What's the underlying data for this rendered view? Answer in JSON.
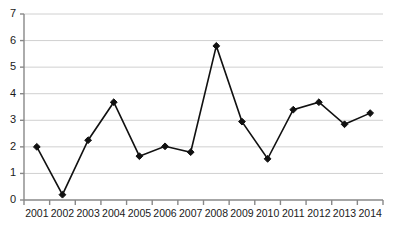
{
  "chart_data": {
    "type": "line",
    "title": "",
    "subtitle": "",
    "xlabel": "",
    "ylabel": "",
    "categories": [
      "2001",
      "2002",
      "2003",
      "2004",
      "2005",
      "2006",
      "2007",
      "2008",
      "2009",
      "2010",
      "2011",
      "2012",
      "2013",
      "2014"
    ],
    "values": [
      2.0,
      0.2,
      2.25,
      3.68,
      1.65,
      2.02,
      1.8,
      5.8,
      2.95,
      1.55,
      3.4,
      3.68,
      2.85,
      3.27
    ],
    "series": [
      {
        "name": "",
        "values": [
          2.0,
          0.2,
          2.25,
          3.68,
          1.65,
          2.02,
          1.8,
          5.8,
          2.95,
          1.55,
          3.4,
          3.68,
          2.85,
          3.27
        ]
      }
    ],
    "ylim": [
      0,
      7
    ],
    "ytick_labels": [
      "0",
      "1",
      "2",
      "3",
      "4",
      "5",
      "6",
      "7"
    ],
    "ytick_values": [
      0,
      1,
      2,
      3,
      4,
      5,
      6,
      7
    ],
    "xtick_labels": [
      "2001",
      "2002",
      "2003",
      "2004",
      "2005",
      "2006",
      "2007",
      "2008",
      "2009",
      "2010",
      "2011",
      "2012",
      "2013",
      "2014"
    ],
    "grid": true,
    "grid_axis": "y",
    "legend": false,
    "legend_position": "none",
    "marker": "diamond",
    "line_color": "#111111",
    "marker_color": "#111111",
    "grid_color": "#d0d0d0",
    "axis_color": "#888888",
    "text_color": "#1a1a1a",
    "background": "#ffffff"
  }
}
